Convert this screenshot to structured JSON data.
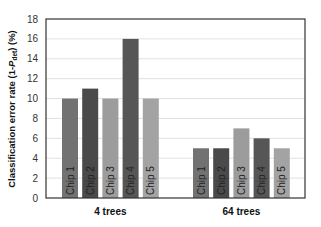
{
  "chart_data": {
    "type": "bar",
    "title": "",
    "xlabel": "",
    "ylabel": "Classification error rate (1-P_det) (%)",
    "ylabel_parts": {
      "prefix": "Classification error rate (1-",
      "italic": "P",
      "subscript": "det",
      "suffix": ") (%)"
    },
    "ylim": [
      0,
      18
    ],
    "yticks": [
      0,
      2,
      4,
      6,
      8,
      10,
      12,
      14,
      16,
      18
    ],
    "grid": true,
    "legend": "none (bar labels inside bars)",
    "categories": [
      "4 trees",
      "64 trees"
    ],
    "series": [
      {
        "name": "Chip 1",
        "color": "#727272",
        "values": [
          10,
          5
        ]
      },
      {
        "name": "Chip 2",
        "color": "#4a4a4a",
        "values": [
          11,
          5
        ]
      },
      {
        "name": "Chip 3",
        "color": "#9c9c9c",
        "values": [
          10,
          7
        ]
      },
      {
        "name": "Chip 4",
        "color": "#565656",
        "values": [
          16,
          6
        ]
      },
      {
        "name": "Chip 5",
        "color": "#a3a3a3",
        "values": [
          10,
          5
        ]
      }
    ]
  }
}
